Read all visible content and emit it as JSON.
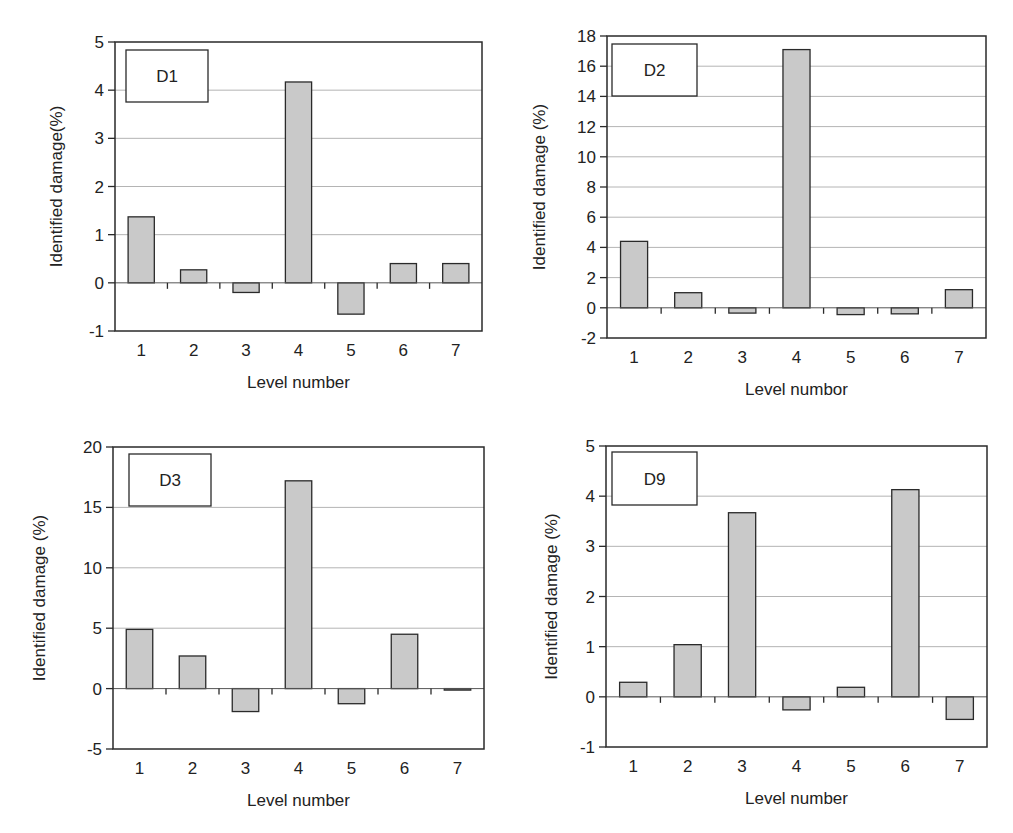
{
  "figure": {
    "panels": [
      "D1",
      "D2",
      "D3",
      "D9"
    ]
  },
  "chart_data": [
    {
      "type": "bar",
      "title": "D1",
      "legend_label": "D1",
      "categories": [
        "1",
        "2",
        "3",
        "4",
        "5",
        "6",
        "7"
      ],
      "values": [
        1.37,
        0.27,
        -0.2,
        4.17,
        -0.65,
        0.4,
        0.4
      ],
      "xlabel": "Level number",
      "ylabel": "Identified damage(%)",
      "ylim": [
        -1,
        5
      ],
      "yticks": [
        -1,
        0,
        1,
        2,
        3,
        4,
        5
      ],
      "grid": true,
      "layout": {
        "x0": 115,
        "x1": 482,
        "y0": 42,
        "y1": 331,
        "ylabel_x": 62,
        "box": {
          "x": 126,
          "y": 50,
          "w": 82,
          "h": 52
        }
      }
    },
    {
      "type": "bar",
      "title": "D2",
      "legend_label": "D2",
      "categories": [
        "1",
        "2",
        "3",
        "4",
        "5",
        "6",
        "7"
      ],
      "values": [
        4.4,
        1.0,
        -0.35,
        17.1,
        -0.45,
        -0.4,
        1.2
      ],
      "xlabel": "Level numbor",
      "ylabel": "Identified damage (%)",
      "ylim": [
        -2,
        18
      ],
      "yticks": [
        -2,
        0,
        2,
        4,
        6,
        8,
        10,
        12,
        14,
        16,
        18
      ],
      "grid": true,
      "layout": {
        "x0": 607,
        "x1": 986,
        "y0": 36,
        "y1": 338,
        "ylabel_x": 545,
        "box": {
          "x": 612,
          "y": 44,
          "w": 85,
          "h": 52
        }
      }
    },
    {
      "type": "bar",
      "title": "D3",
      "legend_label": "D3",
      "categories": [
        "1",
        "2",
        "3",
        "4",
        "5",
        "6",
        "7"
      ],
      "values": [
        4.9,
        2.7,
        -1.9,
        17.2,
        -1.25,
        4.5,
        -0.1
      ],
      "xlabel": "Level number",
      "ylabel": "Identified damage (%)",
      "ylim": [
        -5,
        20
      ],
      "yticks": [
        -5,
        0,
        5,
        10,
        15,
        20
      ],
      "grid": true,
      "layout": {
        "x0": 113,
        "x1": 484,
        "y0": 447,
        "y1": 749,
        "ylabel_x": 45,
        "box": {
          "x": 129,
          "y": 454,
          "w": 82,
          "h": 52
        }
      }
    },
    {
      "type": "bar",
      "title": "D9",
      "legend_label": "D9",
      "categories": [
        "1",
        "2",
        "3",
        "4",
        "5",
        "6",
        "7"
      ],
      "values": [
        0.29,
        1.04,
        3.67,
        -0.26,
        0.19,
        4.13,
        -0.45
      ],
      "xlabel": "Level number",
      "ylabel": "Identified damage (%)",
      "ylim": [
        -1,
        5
      ],
      "yticks": [
        -1,
        0,
        1,
        2,
        3,
        4,
        5
      ],
      "grid": true,
      "layout": {
        "x0": 606,
        "x1": 987,
        "y0": 446,
        "y1": 747,
        "ylabel_x": 557,
        "box": {
          "x": 612,
          "y": 452,
          "w": 85,
          "h": 53
        }
      }
    }
  ],
  "style": {
    "bar_fill": "#c9c9c9",
    "bar_stroke": "#2a2a2a",
    "axis_color": "#2a2a2a",
    "grid_color": "#b4b4b4",
    "background": "#ffffff"
  }
}
